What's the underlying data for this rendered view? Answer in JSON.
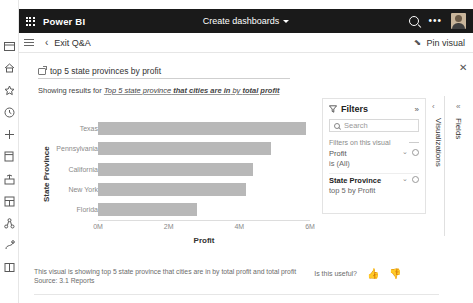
{
  "topbar": {
    "waffle_icon": "app-launcher-icon",
    "brand": "Power BI",
    "center_title": "Create dashboards",
    "chevron_icon": "chevron-down-icon",
    "search_icon": "search-icon",
    "more_icon": "more-options-icon",
    "avatar_icon": "user-avatar"
  },
  "commandbar": {
    "menu_icon": "hamburger-menu-icon",
    "back_icon": "chevron-left-icon",
    "exit_label": "Exit Q&A",
    "pin_icon": "pin-icon",
    "pin_label": "Pin visual"
  },
  "rail": {
    "items": [
      {
        "name": "navigation-toggle",
        "icon": "hamburger-icon"
      },
      {
        "name": "home",
        "icon": "home-icon"
      },
      {
        "name": "favorites",
        "icon": "star-icon"
      },
      {
        "name": "recent",
        "icon": "clock-icon"
      },
      {
        "name": "create",
        "icon": "plus-icon"
      },
      {
        "name": "datasets",
        "icon": "database-icon"
      },
      {
        "name": "goals",
        "icon": "goals-icon"
      },
      {
        "name": "apps",
        "icon": "apps-grid-icon"
      },
      {
        "name": "shared-with-me",
        "icon": "share-nodes-icon"
      },
      {
        "name": "deployment-pipelines",
        "icon": "pipeline-icon"
      },
      {
        "name": "workspaces",
        "icon": "workspace-icon"
      }
    ]
  },
  "query": {
    "icon": "qna-box-icon",
    "value": "top 5 state provinces by profit",
    "clear_icon": "close-icon",
    "showing_prefix": "Showing results for ",
    "showing_part1": "Top 5 state province",
    "showing_part2": " that cities are in",
    "showing_part3": " by ",
    "showing_part4": "total profit"
  },
  "chart_data": {
    "type": "bar",
    "orientation": "horizontal",
    "categories": [
      "Texas",
      "Pennsylvania",
      "California",
      "New York",
      "Florida"
    ],
    "values": [
      5.9,
      4.9,
      4.4,
      4.2,
      2.8
    ],
    "title": "",
    "xlabel": "Profit",
    "ylabel": "State Province",
    "xticks": [
      "0M",
      "2M",
      "4M",
      "6M"
    ],
    "xtick_values": [
      0,
      2,
      4,
      6
    ],
    "xlim": [
      0,
      6
    ],
    "grid": false,
    "legend": "none",
    "bar_color": "#b8b8b8"
  },
  "filters": {
    "funnel_icon": "funnel-icon",
    "title": "Filters",
    "expand_icon": "double-chevron-right-icon",
    "search_icon": "search-icon",
    "search_placeholder": "Search",
    "section_label": "Filters on this visual",
    "cards": [
      {
        "name": "Profit",
        "value": "is (All)",
        "bold": false,
        "chevron_icon": "chevron-down-icon",
        "action_icon": "eraser-icon"
      },
      {
        "name": "State Province",
        "value": "top 5 by Profit",
        "bold": true,
        "chevron_icon": "chevron-down-icon",
        "action_icon": "eraser-icon"
      }
    ]
  },
  "right_rail": {
    "collapse_icon": "chevron-left-icon",
    "double_collapse_icon": "double-chevron-left-icon",
    "fields_label": "Fields",
    "visualizations_label": "Visualizations"
  },
  "footer": {
    "line1": "This visual is showing top 5 state province that cities are in by total profit and total profit",
    "line2": "Source: 3.1 Reports",
    "useful_label": "Is this useful?",
    "thumbs_up_icon": "thumbs-up-icon",
    "thumbs_down_icon": "thumbs-down-icon"
  }
}
